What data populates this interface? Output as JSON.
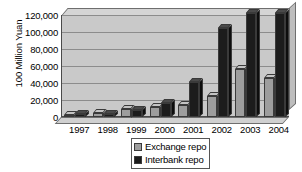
{
  "chart_data": {
    "type": "bar",
    "title": "",
    "subtitle": "",
    "xlabel": "",
    "ylabel": "100 Million Yuan",
    "ylim": [
      0,
      120000
    ],
    "ytick_labels": [
      "120,000",
      "100,000",
      "80,000",
      "60,000",
      "40,000",
      "20,000",
      "0"
    ],
    "ytick_values": [
      120000,
      100000,
      80000,
      60000,
      40000,
      20000,
      0
    ],
    "grid": true,
    "legend_position": "bottom-center",
    "style": "3d-clustered-column",
    "categories": [
      "1997",
      "1998",
      "1999",
      "2000",
      "2001",
      "2002",
      "2003",
      "2004"
    ],
    "series": [
      {
        "name": "Exchange repo",
        "color": "#9d9d9d",
        "values": [
          2000,
          5000,
          10000,
          12000,
          14000,
          25000,
          56000,
          46000
        ]
      },
      {
        "name": "Interbank repo",
        "color": "#1c1c1c",
        "values": [
          3000,
          4000,
          8000,
          17000,
          41000,
          105000,
          122000,
          122000
        ]
      }
    ]
  },
  "legend": {
    "entries": [
      {
        "label": "Exchange repo",
        "swatch": "exchange"
      },
      {
        "label": "Interbank repo",
        "swatch": "interbank"
      }
    ]
  },
  "colors": {
    "plot_background": "#c9c9c9",
    "gridline": "#8c8c8c",
    "axis": "#4a4a4a",
    "exchange_repo": "#9d9d9d",
    "interbank_repo": "#1c1c1c"
  }
}
